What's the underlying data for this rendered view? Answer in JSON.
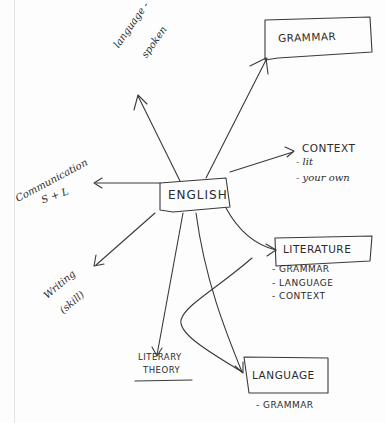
{
  "diagram": {
    "type": "mind-map",
    "style": "hand-drawn pen on paper",
    "ink_color": "#2b2b2b",
    "paper_color": "#fdfdfd",
    "center": {
      "label": "ENGLISH"
    },
    "nodes": {
      "grammar": {
        "label": "GRAMMAR",
        "boxed": true
      },
      "language_spoken": {
        "line1": "language -",
        "line2": "spoken",
        "boxed": false
      },
      "context": {
        "label": "CONTEXT",
        "items": [
          "- lit",
          "- your own"
        ]
      },
      "communication": {
        "line1": "Communication",
        "line2": "S + L",
        "boxed": false
      },
      "literature": {
        "label": "LITERATURE",
        "boxed": true,
        "items": [
          "- GRAMMAR",
          "- LANGUAGE",
          "- CONTEXT"
        ]
      },
      "writing": {
        "line1": "Writing",
        "line2": "(skill)",
        "boxed": false
      },
      "literary_theory": {
        "line1": "LITERARY",
        "line2": "THEORY",
        "boxed": false
      },
      "language": {
        "label": "LANGUAGE",
        "boxed": true,
        "items": [
          "- GRAMMAR"
        ]
      }
    },
    "edges": [
      {
        "from": "ENGLISH",
        "to": "GRAMMAR"
      },
      {
        "from": "ENGLISH",
        "to": "language - spoken"
      },
      {
        "from": "ENGLISH",
        "to": "CONTEXT"
      },
      {
        "from": "ENGLISH",
        "to": "Communication S + L"
      },
      {
        "from": "ENGLISH",
        "to": "LITERATURE"
      },
      {
        "from": "ENGLISH",
        "to": "Writing (skill)"
      },
      {
        "from": "ENGLISH",
        "to": "LITERARY THEORY"
      },
      {
        "from": "ENGLISH",
        "to": "LANGUAGE"
      },
      {
        "from": "LITERATURE",
        "to": "LANGUAGE",
        "note": "curved connector"
      }
    ]
  }
}
